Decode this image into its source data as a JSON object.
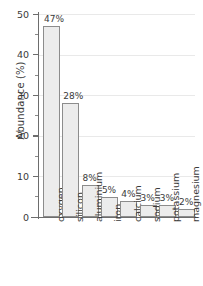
{
  "chart_data": {
    "type": "bar",
    "title": "",
    "subtitle": "",
    "xlabel": "",
    "ylabel": "Abundance (%)",
    "ylim": [
      0,
      50
    ],
    "y_major_ticks": [
      0,
      10,
      20,
      30,
      40,
      50
    ],
    "y_minor_ticks": [
      5,
      15,
      25,
      35,
      45
    ],
    "y_tick_labels": [
      "0",
      "10",
      "20",
      "30",
      "40",
      "50"
    ],
    "grid": "horizontal",
    "legend": "none",
    "categories": [
      "oxygen",
      "silicon",
      "aluminium",
      "iron",
      "calcium",
      "sodium",
      "potassium",
      "magnesium"
    ],
    "values": [
      47,
      28,
      8,
      5,
      4,
      3,
      3,
      2
    ],
    "data_labels": [
      "47%",
      "28%",
      "8%",
      "5%",
      "4%",
      "3%",
      "3%",
      "2%"
    ],
    "colors": {
      "bar_fill": "#ececec",
      "bar_edge": "#8c8c8c",
      "axis": "#6d6d6d",
      "grid": "#e9e9e9",
      "text": "#3a3a3a",
      "background": "#ffffff"
    }
  }
}
